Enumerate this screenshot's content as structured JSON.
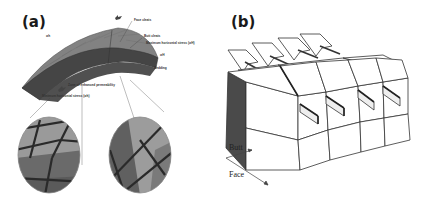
{
  "figure": {
    "panels": [
      {
        "id": "a",
        "label": "(a)",
        "description": "Curved coal seam (anticline) with cleat system and magnified circular insets",
        "annotations": {
          "face_cleats": "Face cleats",
          "butt_cleats": "Butt cleats",
          "max_stress": "Maximum horizontal stress (σH)",
          "sigma_H": "σH",
          "bedding": "Bedding",
          "zone": "Zone of enhanced permeability",
          "min_stress": "Minimum horizontal stress (σh)",
          "sigma_h": "σh"
        }
      },
      {
        "id": "b",
        "label": "(b)",
        "description": "Block diagram of coal showing face and butt cleat directions with arrows",
        "annotations": {
          "butt": "Butt",
          "face": "Face"
        }
      }
    ],
    "colors": {
      "seam_top": "#7a7a7a",
      "seam_front": "#3f3f3f",
      "inset_light": "#9a9a9a",
      "inset_dark": "#5e5e5e",
      "cleat_line": "#2a2a2a",
      "block_dark": "#4a4a4a",
      "outline": "#333333"
    }
  }
}
